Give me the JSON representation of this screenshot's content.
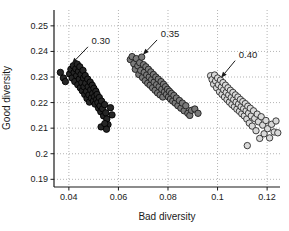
{
  "figure": {
    "background": "#ffffff",
    "text_color": "#1a1a1a"
  },
  "chart_data": {
    "type": "scatter",
    "title": "",
    "xlabel": "Bad diversity",
    "ylabel": "Good diversity",
    "xlim": [
      0.034,
      0.1252
    ],
    "ylim": [
      0.187,
      0.2562
    ],
    "xticks": [
      0.04,
      0.06,
      0.08,
      0.1,
      0.12
    ],
    "xtick_labels": [
      "0.04",
      "0.06",
      "0.08",
      "0.1",
      "0.12"
    ],
    "yticks": [
      0.19,
      0.2,
      0.21,
      0.22,
      0.23,
      0.24,
      0.25
    ],
    "ytick_labels": [
      "0.19",
      "0.2",
      "0.21",
      "0.22",
      "0.23",
      "0.24",
      "0.25"
    ],
    "grid": "dotted",
    "grid_color": "#b5b5b5",
    "axis_color": "#1a1a1a",
    "legend": "none",
    "series": [
      {
        "name": "0.30",
        "marker": "circle",
        "marker_fill": "#262626",
        "marker_edge": "#000000",
        "points": [
          [
            0.0366,
            0.2318
          ],
          [
            0.0378,
            0.2296
          ],
          [
            0.0386,
            0.2282
          ],
          [
            0.0403,
            0.2312
          ],
          [
            0.0408,
            0.233
          ],
          [
            0.0413,
            0.2296
          ],
          [
            0.0418,
            0.2344
          ],
          [
            0.0421,
            0.2318
          ],
          [
            0.0424,
            0.2282
          ],
          [
            0.0428,
            0.2332
          ],
          [
            0.0431,
            0.2305
          ],
          [
            0.0434,
            0.235
          ],
          [
            0.0436,
            0.227
          ],
          [
            0.0439,
            0.2322
          ],
          [
            0.0442,
            0.2292
          ],
          [
            0.0444,
            0.234
          ],
          [
            0.0446,
            0.2258
          ],
          [
            0.0449,
            0.231
          ],
          [
            0.0452,
            0.2278
          ],
          [
            0.0454,
            0.2246
          ],
          [
            0.0457,
            0.2326
          ],
          [
            0.0459,
            0.2296
          ],
          [
            0.0461,
            0.2262
          ],
          [
            0.0464,
            0.2232
          ],
          [
            0.0466,
            0.2306
          ],
          [
            0.0468,
            0.2276
          ],
          [
            0.0471,
            0.2244
          ],
          [
            0.0473,
            0.2216
          ],
          [
            0.0476,
            0.2292
          ],
          [
            0.0478,
            0.2262
          ],
          [
            0.0481,
            0.223
          ],
          [
            0.0483,
            0.2202
          ],
          [
            0.0486,
            0.228
          ],
          [
            0.0488,
            0.225
          ],
          [
            0.0491,
            0.2218
          ],
          [
            0.0494,
            0.2268
          ],
          [
            0.0496,
            0.2236
          ],
          [
            0.0499,
            0.2206
          ],
          [
            0.0501,
            0.2256
          ],
          [
            0.0504,
            0.2224
          ],
          [
            0.0506,
            0.2194
          ],
          [
            0.0509,
            0.2244
          ],
          [
            0.0512,
            0.2212
          ],
          [
            0.0514,
            0.2232
          ],
          [
            0.0517,
            0.22
          ],
          [
            0.052,
            0.2178
          ],
          [
            0.0523,
            0.222
          ],
          [
            0.0526,
            0.2188
          ],
          [
            0.0529,
            0.2164
          ],
          [
            0.0532,
            0.2206
          ],
          [
            0.0536,
            0.2176
          ],
          [
            0.054,
            0.2148
          ],
          [
            0.0544,
            0.2192
          ],
          [
            0.0549,
            0.216
          ],
          [
            0.0553,
            0.2136
          ],
          [
            0.0558,
            0.2114
          ],
          [
            0.053,
            0.2105
          ],
          [
            0.0545,
            0.2118
          ],
          [
            0.0552,
            0.2096
          ],
          [
            0.0568,
            0.218
          ],
          [
            0.0574,
            0.2152
          ]
        ]
      },
      {
        "name": "0.35",
        "marker": "circle",
        "marker_fill": "#7a7a7a",
        "marker_edge": "#1c1c1c",
        "points": [
          [
            0.0648,
            0.2368
          ],
          [
            0.0655,
            0.238
          ],
          [
            0.0662,
            0.2352
          ],
          [
            0.0668,
            0.233
          ],
          [
            0.0672,
            0.2372
          ],
          [
            0.0678,
            0.2344
          ],
          [
            0.0682,
            0.231
          ],
          [
            0.0686,
            0.2356
          ],
          [
            0.069,
            0.2326
          ],
          [
            0.0694,
            0.2378
          ],
          [
            0.0697,
            0.2298
          ],
          [
            0.0701,
            0.2348
          ],
          [
            0.0704,
            0.2318
          ],
          [
            0.0708,
            0.2286
          ],
          [
            0.0711,
            0.234
          ],
          [
            0.0714,
            0.2308
          ],
          [
            0.0718,
            0.2276
          ],
          [
            0.0721,
            0.233
          ],
          [
            0.0724,
            0.23
          ],
          [
            0.0728,
            0.2268
          ],
          [
            0.0731,
            0.232
          ],
          [
            0.0734,
            0.229
          ],
          [
            0.0738,
            0.2258
          ],
          [
            0.0741,
            0.231
          ],
          [
            0.0744,
            0.228
          ],
          [
            0.0748,
            0.2248
          ],
          [
            0.0751,
            0.23
          ],
          [
            0.0754,
            0.227
          ],
          [
            0.0758,
            0.2238
          ],
          [
            0.0761,
            0.2292
          ],
          [
            0.0764,
            0.2262
          ],
          [
            0.0768,
            0.223
          ],
          [
            0.0772,
            0.2282
          ],
          [
            0.0775,
            0.2252
          ],
          [
            0.0779,
            0.2222
          ],
          [
            0.0782,
            0.2272
          ],
          [
            0.0786,
            0.2242
          ],
          [
            0.079,
            0.2262
          ],
          [
            0.0794,
            0.2232
          ],
          [
            0.0798,
            0.2252
          ],
          [
            0.0802,
            0.2222
          ],
          [
            0.0806,
            0.2244
          ],
          [
            0.081,
            0.2214
          ],
          [
            0.0814,
            0.2236
          ],
          [
            0.0819,
            0.2206
          ],
          [
            0.0824,
            0.2228
          ],
          [
            0.0829,
            0.2198
          ],
          [
            0.0834,
            0.2218
          ],
          [
            0.084,
            0.2188
          ],
          [
            0.0846,
            0.2208
          ],
          [
            0.0852,
            0.2178
          ],
          [
            0.0858,
            0.2198
          ],
          [
            0.0865,
            0.2168
          ],
          [
            0.0872,
            0.2188
          ],
          [
            0.088,
            0.2158
          ],
          [
            0.0888,
            0.215
          ],
          [
            0.0895,
            0.217
          ],
          [
            0.0908,
            0.2175
          ],
          [
            0.0921,
            0.2158
          ]
        ]
      },
      {
        "name": "0.40",
        "marker": "circle",
        "marker_fill": "#d9d9d9",
        "marker_edge": "#2b2b2b",
        "points": [
          [
            0.0972,
            0.2305
          ],
          [
            0.0978,
            0.229
          ],
          [
            0.0984,
            0.2272
          ],
          [
            0.0988,
            0.2308
          ],
          [
            0.0992,
            0.2285
          ],
          [
            0.0996,
            0.2258
          ],
          [
            0.1,
            0.2296
          ],
          [
            0.1004,
            0.227
          ],
          [
            0.1008,
            0.2242
          ],
          [
            0.1012,
            0.2288
          ],
          [
            0.1015,
            0.226
          ],
          [
            0.1018,
            0.2232
          ],
          [
            0.1022,
            0.2278
          ],
          [
            0.1025,
            0.225
          ],
          [
            0.1028,
            0.2222
          ],
          [
            0.1032,
            0.2268
          ],
          [
            0.1035,
            0.224
          ],
          [
            0.1038,
            0.2212
          ],
          [
            0.1042,
            0.2258
          ],
          [
            0.1045,
            0.223
          ],
          [
            0.1048,
            0.2202
          ],
          [
            0.1052,
            0.2248
          ],
          [
            0.1055,
            0.222
          ],
          [
            0.1058,
            0.2192
          ],
          [
            0.1062,
            0.224
          ],
          [
            0.1065,
            0.2212
          ],
          [
            0.1068,
            0.2184
          ],
          [
            0.1072,
            0.223
          ],
          [
            0.1075,
            0.2202
          ],
          [
            0.1078,
            0.2174
          ],
          [
            0.1082,
            0.2222
          ],
          [
            0.1085,
            0.2194
          ],
          [
            0.1088,
            0.2166
          ],
          [
            0.1092,
            0.2212
          ],
          [
            0.1095,
            0.2184
          ],
          [
            0.1098,
            0.2156
          ],
          [
            0.1102,
            0.2204
          ],
          [
            0.1105,
            0.2176
          ],
          [
            0.1108,
            0.2148
          ],
          [
            0.1112,
            0.2196
          ],
          [
            0.1115,
            0.2168
          ],
          [
            0.1118,
            0.2136
          ],
          [
            0.1122,
            0.2186
          ],
          [
            0.1125,
            0.2158
          ],
          [
            0.1128,
            0.212
          ],
          [
            0.1132,
            0.2178
          ],
          [
            0.1136,
            0.2148
          ],
          [
            0.114,
            0.2108
          ],
          [
            0.1145,
            0.2168
          ],
          [
            0.115,
            0.2138
          ],
          [
            0.1155,
            0.209
          ],
          [
            0.116,
            0.2155
          ],
          [
            0.1165,
            0.2125
          ],
          [
            0.117,
            0.206
          ],
          [
            0.1176,
            0.2145
          ],
          [
            0.1182,
            0.2112
          ],
          [
            0.1188,
            0.2078
          ],
          [
            0.1195,
            0.213
          ],
          [
            0.1202,
            0.2098
          ],
          [
            0.121,
            0.2062
          ],
          [
            0.1218,
            0.2115
          ],
          [
            0.1228,
            0.2085
          ],
          [
            0.112,
            0.2032
          ],
          [
            0.1236,
            0.2128
          ],
          [
            0.1243,
            0.2082
          ]
        ]
      }
    ],
    "annotations": [
      {
        "label": "0.30",
        "text_xy": [
          0.0529,
          0.2442
        ],
        "arrow_from": [
          0.0477,
          0.2418
        ],
        "arrow_to": [
          0.0412,
          0.2352
        ]
      },
      {
        "label": "0.35",
        "text_xy": [
          0.0808,
          0.2469
        ],
        "arrow_from": [
          0.0756,
          0.2445
        ],
        "arrow_to": [
          0.0699,
          0.2387
        ]
      },
      {
        "label": "0.40",
        "text_xy": [
          0.1123,
          0.2387
        ],
        "arrow_from": [
          0.1071,
          0.2364
        ],
        "arrow_to": [
          0.1014,
          0.2297
        ]
      }
    ]
  }
}
